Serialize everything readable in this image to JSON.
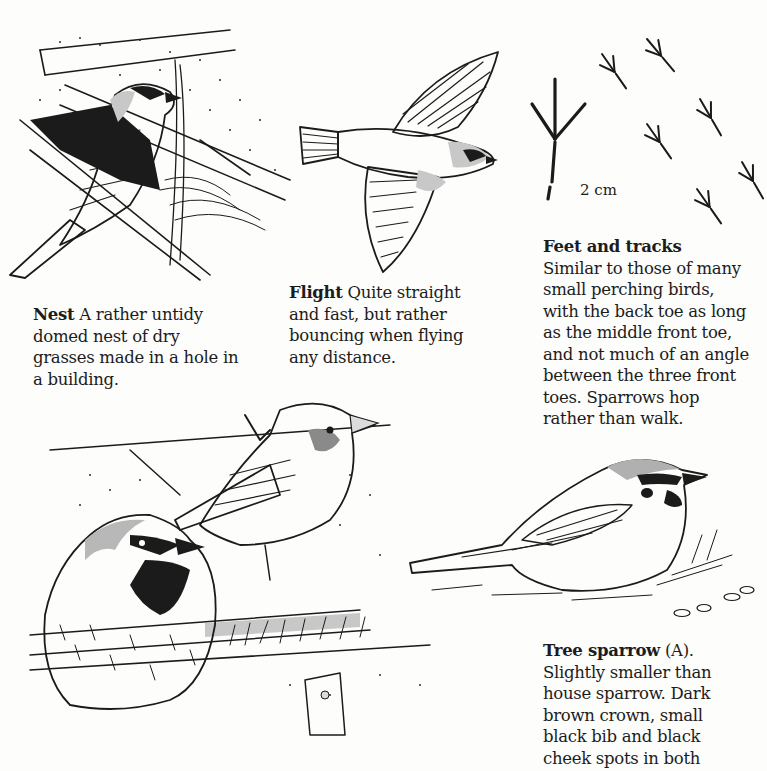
{
  "page": {
    "background": "#fdfdfb",
    "ink_color": "#1b1b1b",
    "shade_color": "#c8c8c8"
  },
  "illustrations": {
    "nest": {
      "label": "House sparrow carrying grass to nest under roof"
    },
    "flight": {
      "label": "Sparrow in flight, from below"
    },
    "tracks": {
      "label": "Sparrow footprint and hopping tracks",
      "scale": "2 cm"
    },
    "house_sparrows": {
      "label": "Male and female house sparrow perched on wooden rail"
    },
    "tree_sparrow": {
      "label": "Tree sparrow (A) on ground"
    }
  },
  "captions": {
    "nest": {
      "title": "Nest",
      "lines": [
        " A rather untidy",
        "domed nest of dry",
        "grasses made in a hole in",
        "a building."
      ]
    },
    "flight": {
      "title": "Flight",
      "lines": [
        " Quite straight",
        "and fast, but rather",
        "bouncing when flying",
        "any distance."
      ]
    },
    "feet": {
      "title": "Feet and tracks",
      "lines": [
        "Similar to those of many",
        "small perching birds,",
        "with the back toe as long",
        "as the middle front toe,",
        "and not much of an angle",
        "between the three front",
        "toes. Sparrows hop",
        "rather than walk."
      ]
    },
    "tree_sparrow": {
      "title": "Tree sparrow",
      "title_suffix": " (A).",
      "lines": [
        "Slightly smaller than",
        "house sparrow. Dark",
        "brown crown, small",
        "black bib and black",
        "cheek spots in both"
      ]
    }
  }
}
